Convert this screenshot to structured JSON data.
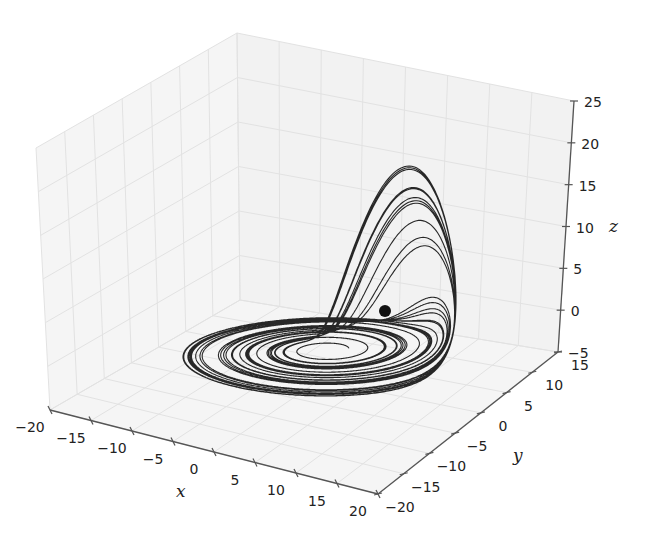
{
  "chart_data": {
    "type": "line3d",
    "title": "",
    "xlabel": "x",
    "ylabel": "y",
    "zlabel": "z",
    "xlim": [
      -20,
      20
    ],
    "ylim": [
      -20,
      15
    ],
    "zlim": [
      -5,
      25
    ],
    "xticks": [
      -20,
      -15,
      -10,
      -5,
      0,
      5,
      10,
      15,
      20
    ],
    "yticks": [
      -20,
      -15,
      -10,
      -5,
      0,
      5,
      10,
      15
    ],
    "zticks": [
      -5,
      0,
      5,
      10,
      15,
      20,
      25
    ],
    "xtick_labels": [
      "−20",
      "−15",
      "−10",
      "−5",
      "0",
      "5",
      "10",
      "15",
      "20"
    ],
    "ytick_labels": [
      "−20",
      "−15",
      "−10",
      "−5",
      "0",
      "5",
      "10",
      "15"
    ],
    "ztick_labels": [
      "−5",
      "0",
      "5",
      "10",
      "15",
      "20",
      "25"
    ],
    "grid": true,
    "legend": null,
    "series": [
      {
        "name": "trajectory",
        "system": "Rossler",
        "params": {
          "a": 0.2,
          "b": 0.2,
          "c": 5.7
        },
        "initial_point": [
          1.0,
          1.0,
          0.0
        ],
        "approx_ranges": {
          "x": [
            -10,
            12
          ],
          "y": [
            -11,
            8
          ],
          "z": [
            0,
            23
          ]
        },
        "color": "#111111"
      }
    ],
    "markers": [
      {
        "name": "start-point",
        "color": "#111111"
      }
    ]
  },
  "colors": {
    "pane": "#f5f5f5",
    "grid": "#e2e2e2",
    "axis": "#555555",
    "line": "#111111"
  }
}
